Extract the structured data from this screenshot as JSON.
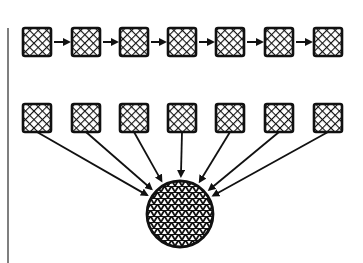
{
  "diagram": {
    "colors": {
      "ink": "#111111",
      "paper": "#ffffff",
      "rule": "#555555"
    },
    "left_rule": {
      "x": 8,
      "y1": 28,
      "y2": 263
    },
    "top_row": {
      "label": "sequential-chain",
      "y": 42,
      "box_size": 28,
      "nodes": [
        37,
        86,
        134,
        182,
        230,
        279,
        328
      ]
    },
    "bottom_row": {
      "label": "parallel-sources",
      "y": 118,
      "box_size": 28,
      "nodes": [
        37,
        86,
        134,
        182,
        230,
        279,
        328
      ]
    },
    "sink": {
      "label": "aggregate-circle",
      "cx": 180,
      "cy": 214,
      "r": 33
    }
  }
}
